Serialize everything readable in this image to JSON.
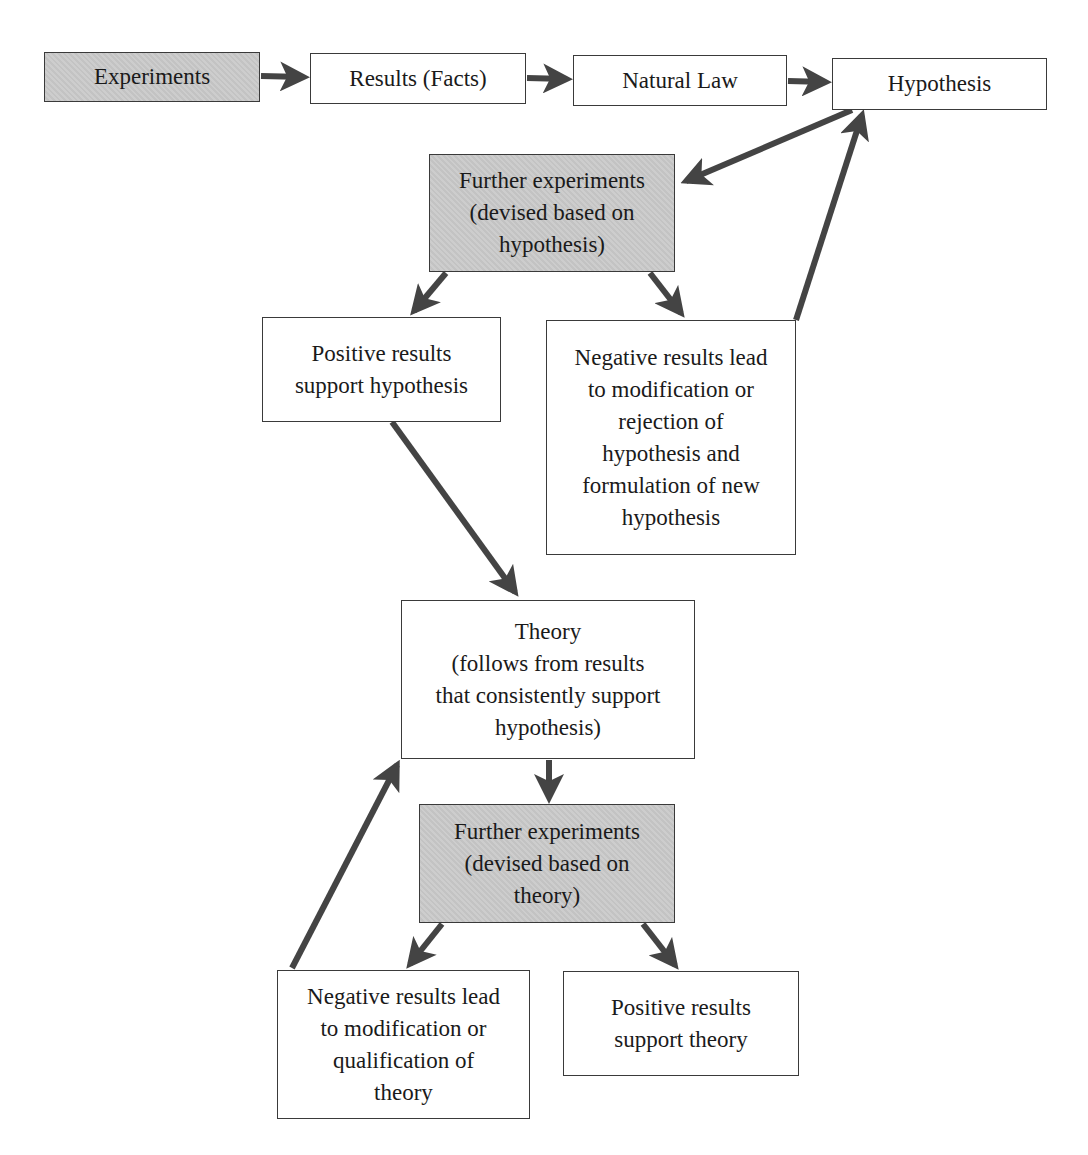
{
  "diagram": {
    "nodes": {
      "experiments": {
        "label": "Experiments",
        "shaded": true
      },
      "results_facts": {
        "label": "Results (Facts)",
        "shaded": false
      },
      "natural_law": {
        "label": "Natural Law",
        "shaded": false
      },
      "hypothesis": {
        "label": "Hypothesis",
        "shaded": false
      },
      "further_experiments_hypothesis": {
        "label": "Further experiments\n(devised based on\nhypothesis)",
        "shaded": true
      },
      "positive_support_hypothesis": {
        "label": "Positive results\nsupport hypothesis",
        "shaded": false
      },
      "negative_modify_hypothesis": {
        "label": "Negative results lead\nto modification or\nrejection of\nhypothesis and\nformulation of new\nhypothesis",
        "shaded": false
      },
      "theory": {
        "label": "Theory\n(follows from results\nthat consistently support\nhypothesis)",
        "shaded": false
      },
      "further_experiments_theory": {
        "label": "Further experiments\n(devised based on\ntheory)",
        "shaded": true
      },
      "negative_modify_theory": {
        "label": "Negative results lead\nto modification or\nqualification of\ntheory",
        "shaded": false
      },
      "positive_support_theory": {
        "label": "Positive results\nsupport theory",
        "shaded": false
      }
    },
    "edges": [
      {
        "from": "experiments",
        "to": "results_facts"
      },
      {
        "from": "results_facts",
        "to": "natural_law"
      },
      {
        "from": "natural_law",
        "to": "hypothesis"
      },
      {
        "from": "hypothesis",
        "to": "further_experiments_hypothesis"
      },
      {
        "from": "further_experiments_hypothesis",
        "to": "positive_support_hypothesis"
      },
      {
        "from": "further_experiments_hypothesis",
        "to": "negative_modify_hypothesis"
      },
      {
        "from": "negative_modify_hypothesis",
        "to": "hypothesis"
      },
      {
        "from": "positive_support_hypothesis",
        "to": "theory"
      },
      {
        "from": "theory",
        "to": "further_experiments_theory"
      },
      {
        "from": "further_experiments_theory",
        "to": "negative_modify_theory"
      },
      {
        "from": "further_experiments_theory",
        "to": "positive_support_theory"
      },
      {
        "from": "negative_modify_theory",
        "to": "theory"
      }
    ],
    "colors": {
      "arrow": "#444444",
      "box_border": "#3a3a3a",
      "shaded_fill": "#c9c9c9",
      "plain_fill": "#ffffff"
    }
  }
}
